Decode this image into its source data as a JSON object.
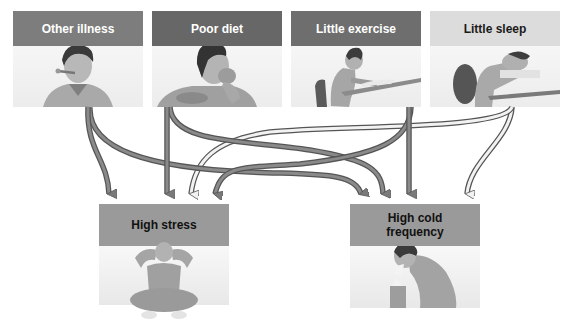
{
  "diagram": {
    "type": "cause-effect flow diagram",
    "causes": [
      {
        "id": "other-illness",
        "label": "Other illness",
        "header_color": "#7d7d7d",
        "text_color": "#ffffff",
        "figure": "person with thermometer in mouth"
      },
      {
        "id": "poor-diet",
        "label": "Poor diet",
        "header_color": "#676767",
        "text_color": "#ffffff",
        "figure": "person eating"
      },
      {
        "id": "little-exercise",
        "label": "Little exercise",
        "header_color": "#6e6e6e",
        "text_color": "#ffffff",
        "figure": "person writing at desk"
      },
      {
        "id": "little-sleep",
        "label": "Little sleep",
        "header_color": "#dcdcdc",
        "text_color": "#1a1a1a",
        "figure": "person asleep on desk"
      }
    ],
    "effects": [
      {
        "id": "high-stress",
        "label": "High stress",
        "header_color": "#9a9a9a",
        "text_color": "#111111",
        "figure": "person sitting holding head"
      },
      {
        "id": "high-cold-frequency",
        "label": "High cold\nfrequency",
        "header_color": "#9a9a9a",
        "text_color": "#111111",
        "figure": "person sneezing into tissue"
      }
    ],
    "arrow_colors": {
      "filled": "#777777",
      "outlined": "#ececec",
      "stroke": "#555555"
    },
    "links": [
      {
        "from": "other-illness",
        "to": "high-stress",
        "style": "filled"
      },
      {
        "from": "other-illness",
        "to": "high-cold-frequency",
        "style": "filled"
      },
      {
        "from": "poor-diet",
        "to": "high-stress",
        "style": "filled"
      },
      {
        "from": "poor-diet",
        "to": "high-cold-frequency",
        "style": "filled"
      },
      {
        "from": "little-exercise",
        "to": "high-stress",
        "style": "filled"
      },
      {
        "from": "little-exercise",
        "to": "high-cold-frequency",
        "style": "filled"
      },
      {
        "from": "little-sleep",
        "to": "high-stress",
        "style": "outlined"
      },
      {
        "from": "little-sleep",
        "to": "high-cold-frequency",
        "style": "outlined"
      }
    ]
  }
}
